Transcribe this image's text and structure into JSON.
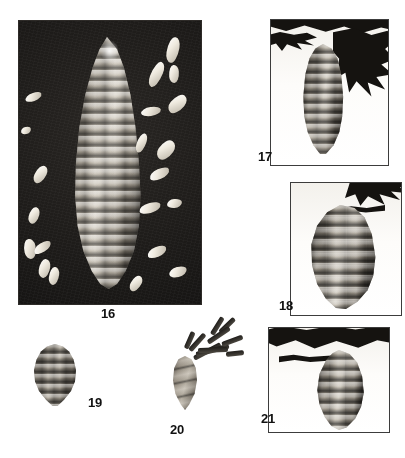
{
  "plate": {
    "type": "botanical-photographic-plate",
    "background_color": "#ffffff",
    "figure_count": 6,
    "label_color": "#111111"
  },
  "figures": [
    {
      "number": "16",
      "label": "16",
      "panel_style": "dark-background photographic plate",
      "background_color": "#1d1b19",
      "subject": "large mature spruce cone, upright, with scattered winged seeds",
      "has_frame": false,
      "label_position": "below-center"
    },
    {
      "number": "17",
      "label": "17",
      "panel_style": "white-background framed photograph",
      "background_color": "#fdfcfa",
      "subject": "pendant conifer cone hanging from needled branch",
      "has_frame": true,
      "label_position": "bottom-left-outside"
    },
    {
      "number": "18",
      "label": "18",
      "panel_style": "white-background framed photograph",
      "background_color": "#fdfcfa",
      "subject": "pendant conifer cone with recurved scales on branch tip",
      "has_frame": true,
      "label_position": "bottom-left-outside"
    },
    {
      "number": "19",
      "label": "19",
      "panel_style": "cut-out specimen on white",
      "background_color": "#ffffff",
      "subject": "small ovoid conifer cone, detached",
      "has_frame": false,
      "label_position": "right-of-subject"
    },
    {
      "number": "20",
      "label": "20",
      "panel_style": "cut-out specimen on white",
      "background_color": "#ffffff",
      "subject": "small cone attached to a short needled twig",
      "has_frame": false,
      "label_position": "below-center"
    },
    {
      "number": "21",
      "label": "21",
      "panel_style": "white-background framed photograph",
      "background_color": "#fdfcfa",
      "subject": "pendant conifer cone beneath horizontal needled branch",
      "has_frame": true,
      "label_position": "bottom-left-outside"
    }
  ]
}
